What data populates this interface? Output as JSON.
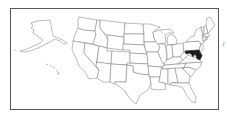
{
  "map": {
    "type": "us-states-locator",
    "highlighted_state": "Maryland",
    "highlight_color": "#1a1a1a",
    "border_color": "#555555",
    "state_stroke_color": "#777777",
    "background_color": "#ffffff",
    "insets": [
      "Alaska",
      "Hawaii"
    ]
  },
  "edge_mark": "/"
}
